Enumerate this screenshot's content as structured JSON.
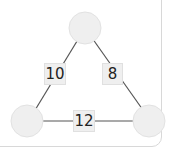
{
  "diagram": {
    "type": "triangle-number-puzzle",
    "nodes": [
      {
        "id": "top",
        "value": ""
      },
      {
        "id": "bottom-left",
        "value": ""
      },
      {
        "id": "bottom-right",
        "value": ""
      }
    ],
    "edges": [
      {
        "from": "top",
        "to": "bottom-left",
        "label": "10"
      },
      {
        "from": "top",
        "to": "bottom-right",
        "label": "8"
      },
      {
        "from": "bottom-left",
        "to": "bottom-right",
        "label": "12"
      }
    ],
    "colors": {
      "node_fill": "#efefef",
      "node_stroke": "#dcdcdc",
      "edge": "#444444"
    }
  }
}
